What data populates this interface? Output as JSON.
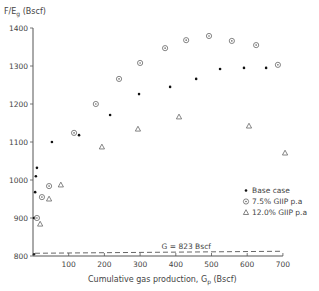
{
  "chart_data": {
    "type": "scatter",
    "title": "",
    "ylabel": "F/E_g (Bscf)",
    "xlabel": "Cumulative gas production, G_p (Bscf)",
    "xlim": [
      0,
      700
    ],
    "ylim": [
      800,
      1400
    ],
    "xticks": [
      100,
      200,
      300,
      400,
      500,
      600,
      700
    ],
    "yticks": [
      800,
      900,
      1000,
      1100,
      1200,
      1300,
      1400
    ],
    "grid": false,
    "legend_position": "lower right",
    "series": [
      {
        "name": "Base case",
        "marker": "dot",
        "points": [
          [
            3,
            900
          ],
          [
            6,
            968
          ],
          [
            8,
            1010
          ],
          [
            11,
            1032
          ],
          [
            53,
            1100
          ],
          [
            129,
            1118
          ],
          [
            216,
            1171
          ],
          [
            297,
            1226
          ],
          [
            384,
            1245
          ],
          [
            457,
            1266
          ],
          [
            524,
            1292
          ],
          [
            591,
            1295
          ],
          [
            653,
            1295
          ]
        ]
      },
      {
        "name": "7.5% GIIP p.a",
        "marker": "circled-dot",
        "points": [
          [
            11,
            900
          ],
          [
            25,
            955
          ],
          [
            45,
            984
          ],
          [
            115,
            1124
          ],
          [
            176,
            1200
          ],
          [
            241,
            1266
          ],
          [
            300,
            1308
          ],
          [
            370,
            1347
          ],
          [
            429,
            1368
          ],
          [
            493,
            1379
          ],
          [
            557,
            1366
          ],
          [
            625,
            1355
          ],
          [
            686,
            1303
          ]
        ]
      },
      {
        "name": "12.0% GIIP p.a",
        "marker": "triangle",
        "points": [
          [
            20,
            884
          ],
          [
            45,
            950
          ],
          [
            78,
            987
          ],
          [
            193,
            1087
          ],
          [
            294,
            1134
          ],
          [
            409,
            1166
          ],
          [
            605,
            1142
          ],
          [
            706,
            1071
          ]
        ]
      }
    ],
    "annotations": [
      {
        "text": "G = 823 Bscf",
        "type": "horizontal-dashed-line",
        "y": 823
      }
    ]
  },
  "labels": {
    "ylabel_main": "F/E",
    "ylabel_sub": "g",
    "ylabel_unit": " (Bscf)",
    "xlabel_main": "Cumulative gas production, G",
    "xlabel_sub": "p",
    "xlabel_unit": " (Bscf)",
    "annotation": "G = 823 Bscf",
    "legend": [
      "Base case",
      "7.5% GIIP p.a",
      "12.0% GIIP p.a"
    ]
  }
}
